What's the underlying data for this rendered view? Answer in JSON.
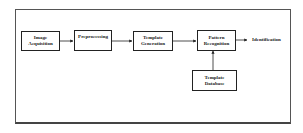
{
  "diagram": {
    "nodes": [
      {
        "id": "image-acquisition",
        "label_line1": "Image",
        "label_line2": "Acquisition"
      },
      {
        "id": "preprocessing",
        "label_line1": "Preprocessing",
        "label_line2": ""
      },
      {
        "id": "template-generation",
        "label_line1": "Template",
        "label_line2": "Generation"
      },
      {
        "id": "pattern-recognition",
        "label_line1": "Pattern",
        "label_line2": "Recognition"
      },
      {
        "id": "template-database",
        "label_line1": "Template",
        "label_line2": "Database"
      }
    ],
    "output_label": "Identification",
    "edges": [
      {
        "from": "image-acquisition",
        "to": "preprocessing"
      },
      {
        "from": "preprocessing",
        "to": "template-generation"
      },
      {
        "from": "template-generation",
        "to": "pattern-recognition"
      },
      {
        "from": "pattern-recognition",
        "to": "identification"
      },
      {
        "from": "template-database",
        "to": "pattern-recognition"
      }
    ]
  }
}
